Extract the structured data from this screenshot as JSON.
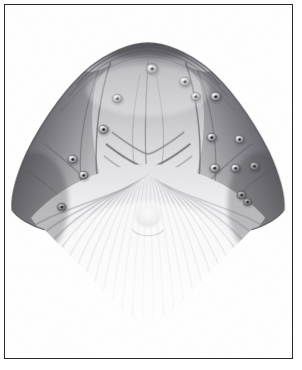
{
  "page": {
    "background_color": "#ffffff",
    "width": 302,
    "height": 370
  },
  "frame": {
    "border_color": "#2a2a2c",
    "border_width_px": 1.3,
    "inset_left": 4,
    "inset_top": 4,
    "inner_width": 289,
    "inner_height": 355,
    "fill_color": "#ffffff"
  },
  "artwork": {
    "title": "",
    "caption": "",
    "medium": "graphite pencil drawing",
    "subject": "humpback whale head, ventral view",
    "style": "monochrome scientific illustration, soft graphite shading on white paper",
    "palette": {
      "paper": "#ffffff",
      "lightest_tone": "#fbfbfb",
      "light_tone": "#e6e6e7",
      "mid_tone": "#b3b3b6",
      "dark_tone": "#76767a",
      "darkest_tone": "#3a3a3e",
      "follicle_dot": "#17171a",
      "outline": "#4a4a4e"
    },
    "composition": {
      "apex_x": 150,
      "apex_y": 42,
      "left_flare_x": 22,
      "right_flare_x": 278,
      "flare_y": 235,
      "chin_tip_y": 310
    },
    "parts": [
      {
        "name": "rostrum-apex",
        "label": "rostrum tip"
      },
      {
        "name": "splash-guard",
        "label": "splash guard / blowhole ridge"
      },
      {
        "name": "median-ridge",
        "label": "median rostral ridge"
      },
      {
        "name": "left-lateral-ridge",
        "label": "left lateral rostral ridge"
      },
      {
        "name": "right-lateral-ridge",
        "label": "right lateral rostral ridge"
      },
      {
        "name": "left-lower-jaw",
        "label": "left lower jaw / mandible"
      },
      {
        "name": "right-lower-jaw",
        "label": "right lower jaw / mandible"
      },
      {
        "name": "throat-pleats",
        "label": "ventral throat pleats"
      },
      {
        "name": "chin-tip",
        "label": "chin protuberance"
      }
    ],
    "tubercles": [
      {
        "cx": 148,
        "cy": 64,
        "r": 5.6,
        "follicle_r": 1.7
      },
      {
        "cx": 181,
        "cy": 77,
        "r": 5.2,
        "follicle_r": 1.6
      },
      {
        "cx": 113,
        "cy": 94,
        "r": 4.8,
        "follicle_r": 1.5
      },
      {
        "cx": 192,
        "cy": 92,
        "r": 4.6,
        "follicle_r": 1.5
      },
      {
        "cx": 212,
        "cy": 92,
        "r": 5.0,
        "follicle_r": 1.6
      },
      {
        "cx": 99,
        "cy": 125,
        "r": 4.8,
        "follicle_r": 1.5
      },
      {
        "cx": 208,
        "cy": 133,
        "r": 4.6,
        "follicle_r": 1.5
      },
      {
        "cx": 236,
        "cy": 135,
        "r": 4.4,
        "follicle_r": 1.4
      },
      {
        "cx": 68,
        "cy": 155,
        "r": 4.6,
        "follicle_r": 1.5
      },
      {
        "cx": 79,
        "cy": 171,
        "r": 4.4,
        "follicle_r": 1.4
      },
      {
        "cx": 211,
        "cy": 164,
        "r": 4.8,
        "follicle_r": 1.5
      },
      {
        "cx": 232,
        "cy": 164,
        "r": 4.4,
        "follicle_r": 1.4
      },
      {
        "cx": 251,
        "cy": 162,
        "r": 4.6,
        "follicle_r": 1.5
      },
      {
        "cx": 57,
        "cy": 203,
        "r": 4.2,
        "follicle_r": 1.3
      },
      {
        "cx": 238,
        "cy": 191,
        "r": 4.4,
        "follicle_r": 1.4
      },
      {
        "cx": 244,
        "cy": 198,
        "r": 4.0,
        "follicle_r": 1.3
      }
    ],
    "pleat_count": 26
  }
}
